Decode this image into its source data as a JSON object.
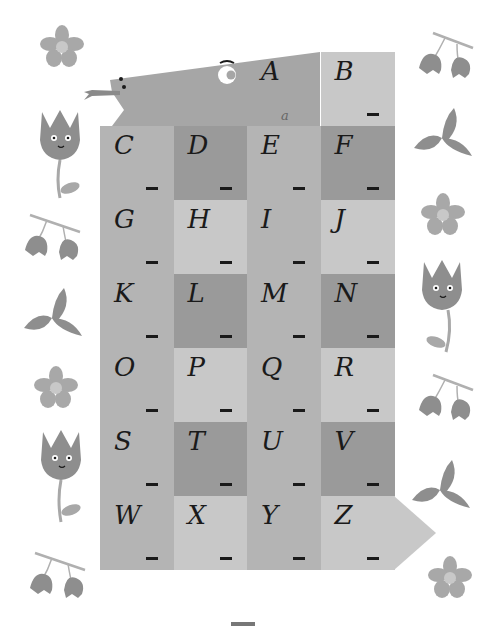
{
  "colors": {
    "light": "#c8c8c8",
    "mid": "#b4b4b4",
    "dark": "#9a9a9a",
    "fish_body": "#a6a6a6",
    "ink": "#1a1a1a",
    "deco": "#8e8e8e",
    "deco_light": "#a8a8a8"
  },
  "worksheet": {
    "lowercase_hint": "a",
    "cells": [
      {
        "letter": "A",
        "blank": "_",
        "shade": "fish"
      },
      {
        "letter": "B",
        "blank": "_",
        "shade": "light"
      },
      {
        "letter": "C",
        "blank": "_",
        "shade": "mid"
      },
      {
        "letter": "D",
        "blank": "_",
        "shade": "dark"
      },
      {
        "letter": "E",
        "blank": "_",
        "shade": "mid"
      },
      {
        "letter": "F",
        "blank": "_",
        "shade": "dark"
      },
      {
        "letter": "G",
        "blank": "_",
        "shade": "mid"
      },
      {
        "letter": "H",
        "blank": "_",
        "shade": "light"
      },
      {
        "letter": "I",
        "blank": "_",
        "shade": "mid"
      },
      {
        "letter": "J",
        "blank": "_",
        "shade": "light"
      },
      {
        "letter": "K",
        "blank": "_",
        "shade": "mid"
      },
      {
        "letter": "L",
        "blank": "_",
        "shade": "dark"
      },
      {
        "letter": "M",
        "blank": "_",
        "shade": "mid"
      },
      {
        "letter": "N",
        "blank": "_",
        "shade": "dark"
      },
      {
        "letter": "O",
        "blank": "_",
        "shade": "mid"
      },
      {
        "letter": "P",
        "blank": "_",
        "shade": "light"
      },
      {
        "letter": "Q",
        "blank": "_",
        "shade": "mid"
      },
      {
        "letter": "R",
        "blank": "_",
        "shade": "light"
      },
      {
        "letter": "S",
        "blank": "_",
        "shade": "mid"
      },
      {
        "letter": "T",
        "blank": "_",
        "shade": "dark"
      },
      {
        "letter": "U",
        "blank": "_",
        "shade": "mid"
      },
      {
        "letter": "V",
        "blank": "_",
        "shade": "dark"
      },
      {
        "letter": "W",
        "blank": "_",
        "shade": "mid"
      },
      {
        "letter": "X",
        "blank": "_",
        "shade": "light"
      },
      {
        "letter": "Y",
        "blank": "_",
        "shade": "mid"
      },
      {
        "letter": "Z",
        "blank": "_",
        "shade": "light"
      }
    ]
  },
  "decorations": {
    "left": [
      "flower",
      "tulip",
      "berries",
      "leaves",
      "flower",
      "tulip",
      "berries"
    ],
    "right": [
      "berries",
      "leaves",
      "flower",
      "tulip",
      "berries",
      "leaves",
      "flower"
    ]
  }
}
